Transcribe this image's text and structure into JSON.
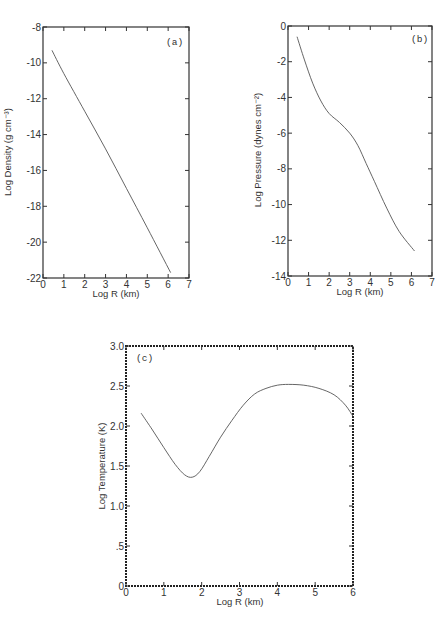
{
  "chart_data": [
    {
      "type": "line",
      "panel_label": "(a)",
      "xlabel": "Log R (km)",
      "ylabel": "Log Density (g cm⁻³)",
      "xlim": [
        0,
        7
      ],
      "ylim": [
        -22,
        -8
      ],
      "xticks": [
        0,
        1,
        2,
        3,
        4,
        5,
        6,
        7
      ],
      "yticks": [
        -8,
        -10,
        -12,
        -14,
        -16,
        -18,
        -20,
        -22
      ],
      "grid": false,
      "series": [
        {
          "name": "density",
          "x": [
            0.43,
            1.0,
            2.0,
            3.0,
            4.0,
            5.0,
            6.12
          ],
          "y": [
            -9.3,
            -10.6,
            -12.7,
            -14.8,
            -17.0,
            -19.2,
            -21.7
          ]
        }
      ],
      "box": {
        "left": 43,
        "right": 189,
        "top": 27,
        "bottom": 278
      }
    },
    {
      "type": "line",
      "panel_label": "(b)",
      "xlabel": "Log R (km)",
      "ylabel": "Log Pressure (dynes cm⁻²)",
      "xlim": [
        0,
        7
      ],
      "ylim": [
        -14,
        0
      ],
      "xticks": [
        0,
        1,
        2,
        3,
        4,
        5,
        6,
        7
      ],
      "yticks": [
        0,
        -2,
        -4,
        -6,
        -8,
        -10,
        -12,
        -14
      ],
      "grid": false,
      "series": [
        {
          "name": "pressure",
          "x": [
            0.44,
            0.8,
            1.2,
            1.6,
            2.0,
            2.5,
            3.0,
            3.4,
            3.8,
            4.2,
            4.8,
            5.4,
            6.15
          ],
          "y": [
            -0.6,
            -1.9,
            -3.2,
            -4.2,
            -4.9,
            -5.4,
            -6.0,
            -6.7,
            -7.7,
            -8.7,
            -10.2,
            -11.5,
            -12.6
          ]
        }
      ],
      "box": {
        "left": 288,
        "right": 432,
        "top": 26,
        "bottom": 276
      }
    },
    {
      "type": "line",
      "panel_label": "(c)",
      "xlabel": "Log R (km)",
      "ylabel": "Log Temperature (K)",
      "xlim": [
        0,
        6
      ],
      "ylim": [
        0,
        3.0
      ],
      "xticks": [
        0,
        1,
        2,
        3,
        4,
        5,
        6
      ],
      "ytick_labels": [
        "0",
        "0.5",
        "1.0",
        "1.5",
        "2.0",
        "2.5",
        "3.0"
      ],
      "yticks": [
        0,
        0.5,
        1.0,
        1.5,
        2.0,
        2.5,
        3.0
      ],
      "grid": false,
      "series": [
        {
          "name": "temperature",
          "x": [
            0.4,
            0.7,
            1.0,
            1.3,
            1.55,
            1.75,
            1.95,
            2.2,
            2.5,
            2.8,
            3.1,
            3.4,
            3.7,
            4.0,
            4.3,
            4.7,
            5.1,
            5.5,
            5.8,
            6.0
          ],
          "y": [
            2.16,
            1.95,
            1.73,
            1.52,
            1.39,
            1.36,
            1.43,
            1.62,
            1.86,
            2.07,
            2.26,
            2.4,
            2.47,
            2.51,
            2.52,
            2.51,
            2.47,
            2.39,
            2.26,
            2.12
          ]
        }
      ],
      "box": {
        "left": 126,
        "right": 353,
        "top": 346,
        "bottom": 586
      }
    }
  ],
  "labels": {
    "a": {
      "panel": "(a)",
      "xlabel": "Log R (km)",
      "ylabel": "Log Density (g cm⁻³)"
    },
    "b": {
      "panel": "(b)",
      "xlabel": "Log R (km)",
      "ylabel": "Log Pressure (dynes cm⁻²)"
    },
    "c": {
      "panel": "(c)",
      "xlabel": "Log R (km)",
      "ylabel": "Log Temperature (K)"
    }
  },
  "tick_labels": {
    "a_x": [
      "0",
      "1",
      "2",
      "3",
      "4",
      "5",
      "6",
      "7"
    ],
    "a_y": [
      "-8",
      "-10",
      "-12",
      "-14",
      "-16",
      "-18",
      "-20",
      "-22"
    ],
    "b_x": [
      "0",
      "1",
      "2",
      "3",
      "4",
      "5",
      "6",
      "7"
    ],
    "b_y": [
      "0",
      "-2",
      "-4",
      "-6",
      "-8",
      "-10",
      "-12",
      "-14"
    ],
    "c_x": [
      "0",
      "1",
      "2",
      "3",
      "4",
      "5",
      "6"
    ],
    "c_y": [
      "0",
      ".5",
      "1.0",
      "1.5",
      "2.0",
      "2.5",
      "3.0"
    ]
  }
}
